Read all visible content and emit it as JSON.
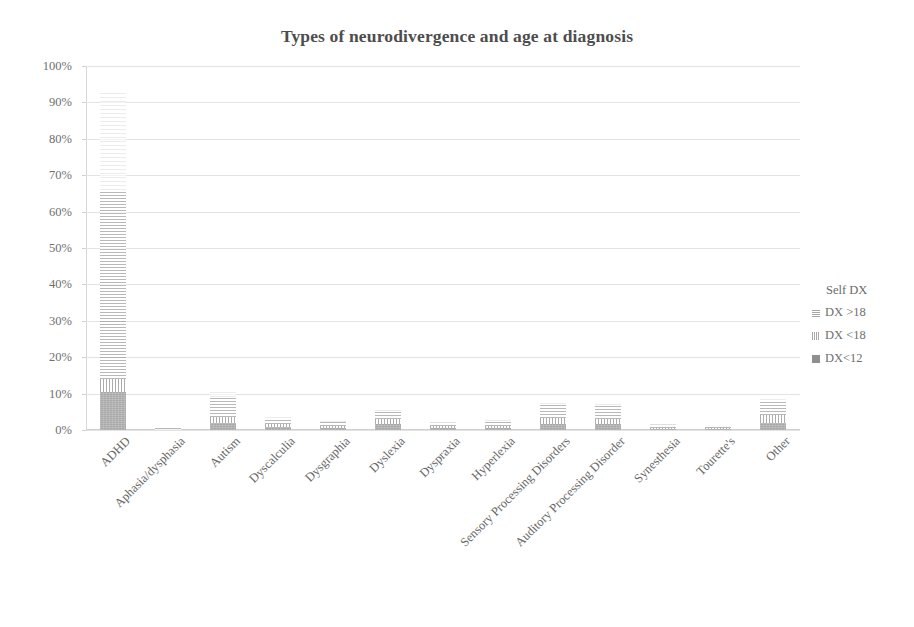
{
  "chart_data": {
    "type": "bar",
    "subtype": "stacked-bar",
    "title": "Types of neurodivergence and age at diagnosis",
    "xlabel": "",
    "ylabel": "",
    "ylim": [
      0,
      100
    ],
    "ytick_labels": [
      "0%",
      "10%",
      "20%",
      "30%",
      "40%",
      "50%",
      "60%",
      "70%",
      "80%",
      "90%",
      "100%"
    ],
    "ytick_values": [
      0,
      10,
      20,
      30,
      40,
      50,
      60,
      70,
      80,
      90,
      100
    ],
    "grid": true,
    "grid_axis": "y",
    "legend_position": "right",
    "legend_title": "Self DX",
    "categories": [
      "ADHD",
      "Aphasia/dysphasia",
      "Autism",
      "Dyscalculia",
      "Dysgraphia",
      "Dyslexia",
      "Dyspraxia",
      "Hyperlexia",
      "Sensory Processing Disorders",
      "Auditory Processing Disorder",
      "Synesthesia",
      "Tourette's",
      "Other"
    ],
    "series": [
      {
        "name": "DX<12",
        "swatch": "dx12",
        "values": [
          10.5,
          0.2,
          2.0,
          0.8,
          0.6,
          1.6,
          0.5,
          0.6,
          1.6,
          1.6,
          0.3,
          0.3,
          2.0
        ]
      },
      {
        "name": "DX <18",
        "swatch": "dxlt18",
        "values": [
          3.5,
          0.2,
          1.6,
          0.8,
          0.5,
          1.4,
          0.5,
          0.6,
          1.6,
          1.4,
          0.3,
          0.2,
          2.2
        ]
      },
      {
        "name": "DX >18",
        "swatch": "dxgt18",
        "values": [
          52.0,
          0.3,
          5.6,
          1.6,
          1.1,
          2.1,
          1.1,
          1.3,
          4.0,
          3.8,
          1.0,
          0.3,
          4.0
        ]
      },
      {
        "name": "Self DX",
        "swatch": "self",
        "values": [
          27.0,
          0.0,
          1.5,
          0.3,
          0.2,
          0.3,
          0.2,
          0.2,
          1.0,
          0.8,
          0.2,
          0.0,
          0.4
        ]
      }
    ]
  },
  "legend": {
    "title": "Self DX",
    "entries": [
      {
        "label": "DX >18",
        "swatch": "dxgt18"
      },
      {
        "label": "DX <18",
        "swatch": "dxlt18"
      },
      {
        "label": "DX<12",
        "swatch": "dx12"
      }
    ]
  },
  "colors": {
    "dx12": "#9b9b9b",
    "dxlt18": "#9a9a9a",
    "dxgt18": "#9d9d9d",
    "self": "#dedede",
    "gridline": "#e3e3e3",
    "text": "#6f6f6f",
    "title": "#4d4d4d",
    "background": "#ffffff"
  }
}
